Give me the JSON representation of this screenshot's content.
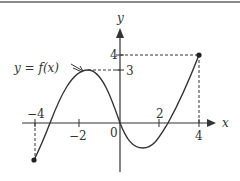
{
  "figure": {
    "curve_label": "y = f(x)",
    "axis_x_label": "x",
    "axis_y_label": "y",
    "x_ticks": [
      {
        "value": -4,
        "label": "−4"
      },
      {
        "value": -2,
        "label": "−2"
      },
      {
        "value": 0,
        "label": "0"
      },
      {
        "value": 2,
        "label": "2"
      },
      {
        "value": 4,
        "label": "4"
      }
    ],
    "y_ticks": [
      {
        "value": 3,
        "label": "3"
      },
      {
        "value": 4,
        "label": "4"
      }
    ],
    "endpoints": [
      {
        "x": -4,
        "y": -2.2,
        "closed": true
      },
      {
        "x": 4,
        "y": 4,
        "closed": true
      }
    ],
    "key_points": [
      {
        "name": "local-max",
        "x": -1.6,
        "y": 3
      },
      {
        "name": "origin-crossing",
        "x": 0,
        "y": 0
      },
      {
        "name": "local-min",
        "x": 1.2,
        "y": -1.4
      },
      {
        "name": "left-root",
        "x": -3.4,
        "y": 0
      },
      {
        "name": "right-root",
        "x": 2.4,
        "y": 0
      }
    ],
    "colors": {
      "curve": "#333333",
      "axis": "#333333",
      "dashed": "#333333",
      "rule": "#8a8a8a"
    }
  }
}
